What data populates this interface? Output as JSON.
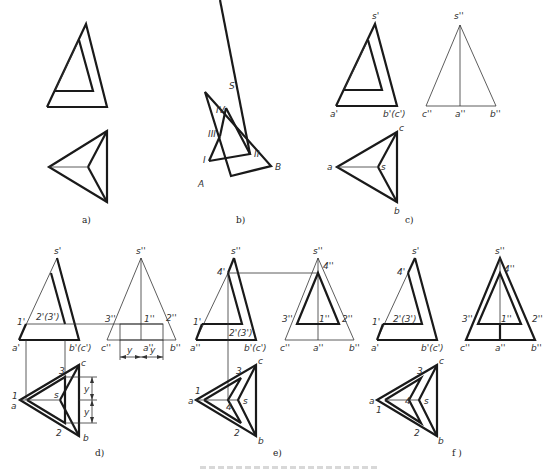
{
  "figure": {
    "caption": "图 三棱锥被截切后的投影作图",
    "panels": [
      {
        "id": "a",
        "label": "a)"
      },
      {
        "id": "b",
        "label": "b)",
        "points": [
          "S",
          "IV",
          "III",
          "I",
          "II",
          "A",
          "B"
        ]
      },
      {
        "id": "c",
        "label": "c)",
        "front": [
          "s'",
          "a'",
          "b'(c')"
        ],
        "side": [
          "s''",
          "c''",
          "a''",
          "b''"
        ],
        "top": [
          "a",
          "s",
          "c",
          "b"
        ]
      },
      {
        "id": "d",
        "label": "d)",
        "front": [
          "s'",
          "1'",
          "2'(3')",
          "a'",
          "b'(c')"
        ],
        "side": [
          "s''",
          "3''",
          "1''",
          "2''",
          "c''",
          "a''",
          "b''"
        ],
        "dims": [
          "y",
          "y"
        ],
        "top": [
          "1",
          "a",
          "3",
          "s",
          "2",
          "c",
          "b"
        ]
      },
      {
        "id": "e",
        "label": "e)",
        "front": [
          "s''",
          "4'",
          "1'",
          "2'(3')",
          "a''",
          "b'(c')"
        ],
        "side": [
          "s''",
          "4''",
          "3''",
          "1''",
          "2''",
          "c''",
          "a''",
          "b''"
        ],
        "top": [
          "1",
          "a",
          "3",
          "4",
          "s",
          "2",
          "c",
          "b"
        ]
      },
      {
        "id": "f",
        "label": "f)",
        "front": [
          "s'",
          "4'",
          "1'",
          "2'(3')",
          "a'",
          "b'(c')"
        ],
        "side": [
          "s''",
          "4''",
          "3''",
          "1''",
          "2''",
          "c''",
          "a''",
          "b''"
        ],
        "top": [
          "a",
          "1",
          "3",
          "4",
          "s",
          "2",
          "c",
          "b"
        ]
      }
    ]
  },
  "labels": {
    "a": {
      "cap": "a)"
    },
    "b": {
      "cap": "b)",
      "S": "S",
      "IV": "IV",
      "III": "III",
      "I": "I",
      "II": "II",
      "A": "A",
      "B": "B"
    },
    "c": {
      "cap": "c)",
      "s1": "s'",
      "a1": "a'",
      "b1": "b'(c')",
      "s2": "s''",
      "c2": "c''",
      "a2": "a''",
      "b2": "b''",
      "a": "a",
      "s": "s",
      "c": "c",
      "b": "b"
    },
    "d": {
      "cap": "d)",
      "s1": "s'",
      "p1": "1'",
      "p23": "2'(3')",
      "a1": "a'",
      "b1": "b'(c')",
      "s2": "s''",
      "p3": "3''",
      "p1b": "1''",
      "p2": "2''",
      "c2": "c''",
      "a2": "a''",
      "b2": "b''",
      "y": "y",
      "t1": "1",
      "ta": "a",
      "t3": "3",
      "ts": "s",
      "t2": "2",
      "tc": "c",
      "tb": "b"
    },
    "e": {
      "cap": "e)",
      "s1": "s''",
      "p4": "4'",
      "p1": "1'",
      "p23": "2'(3')",
      "a1": "a''",
      "b1": "b'(c')",
      "s2": "s''",
      "p4b": "4''",
      "p3": "3''",
      "p1b": "1''",
      "p2": "2''",
      "c2": "c''",
      "a2": "a''",
      "b2": "b''",
      "t1": "1",
      "ta": "a",
      "t3": "3",
      "t4": "4",
      "ts": "s",
      "t2": "2",
      "tc": "c",
      "tb": "b"
    },
    "f": {
      "cap": "f )",
      "s1": "s'",
      "p4": "4'",
      "p1": "1'",
      "p23": "2'(3')",
      "a1": "a'",
      "b1": "b'(c')",
      "s2": "s''",
      "p4b": "4''",
      "p3": "3''",
      "p1b": "1''",
      "p2": "2''",
      "c2": "c''",
      "a2": "a''",
      "b2": "b''",
      "ta": "a",
      "t1": "1",
      "t3": "3",
      "t4": "4",
      "ts": "s",
      "t2": "2",
      "tc": "c",
      "tb": "b"
    }
  },
  "colors": {
    "line": "#1a1a1a",
    "thin": "#333333",
    "background": "#ffffff"
  }
}
